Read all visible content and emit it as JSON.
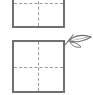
{
  "figures": [
    {
      "id": "box-top",
      "kind": "square-with-dashed-quadrant-lines",
      "partially_cropped": true
    },
    {
      "id": "box-bottom",
      "kind": "square-with-dashed-quadrant-lines",
      "decoration": "leaf-sprig"
    }
  ],
  "colors": {
    "outline": "#6f6f6f",
    "dashes": "#9a9a9a",
    "background": "#ffffff"
  },
  "icons": {
    "sprig": "leaf-sprig-icon"
  }
}
